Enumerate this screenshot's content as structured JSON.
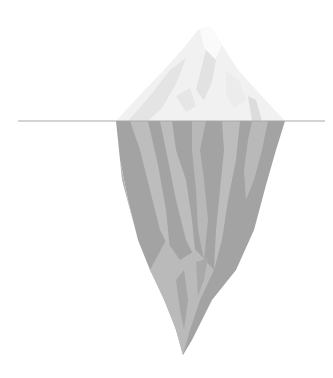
{
  "illustration": {
    "subject": "iceberg",
    "waterline_y": 121,
    "colors": {
      "background": "#ffffff",
      "waterline": "#a8a8a8",
      "tip_light": "#f4f4f4",
      "tip_mid": "#e8e8e8",
      "tip_shadow": "#dcdcdc",
      "underwater_dark": "#a3a3a3",
      "underwater_light": "#bdbdbd"
    }
  }
}
